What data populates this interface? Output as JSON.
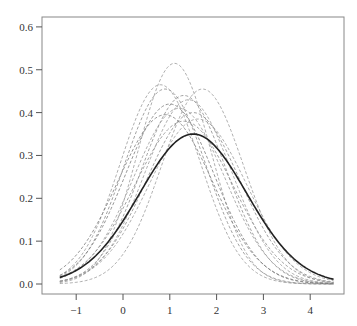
{
  "chart_data": {
    "type": "line",
    "title": "",
    "xlabel": "",
    "ylabel": "",
    "xlim": [
      -1.7,
      4.75
    ],
    "ylim": [
      -0.024,
      0.625
    ],
    "x_range_drawn": [
      -1.35,
      4.5
    ],
    "grid": false,
    "legend": null,
    "x_ticks": [
      -1,
      0,
      1,
      2,
      3,
      4
    ],
    "x_tick_labels": [
      "-1",
      "0",
      "1",
      "2",
      "3",
      "4"
    ],
    "y_ticks": [
      0.0,
      0.1,
      0.2,
      0.3,
      0.4,
      0.5,
      0.6
    ],
    "y_tick_labels": [
      "0.0",
      "0.1",
      "0.2",
      "0.3",
      "0.4",
      "0.5",
      "0.6"
    ],
    "series": [
      {
        "name": "reference-density",
        "style": "solid",
        "color": "#222222",
        "width": 1.6,
        "mean": 1.5,
        "peak": 0.35
      },
      {
        "name": "sample-1",
        "style": "dashed",
        "color": "#9a9a9a",
        "width": 0.8,
        "mean": 1.1,
        "peak": 0.515
      },
      {
        "name": "sample-2",
        "style": "dashed",
        "color": "#9a9a9a",
        "width": 0.8,
        "mean": 0.8,
        "peak": 0.465
      },
      {
        "name": "sample-3",
        "style": "dashed",
        "color": "#8a8a8a",
        "width": 0.8,
        "mean": 0.9,
        "peak": 0.455
      },
      {
        "name": "sample-4",
        "style": "dashed",
        "color": "#9a9a9a",
        "width": 0.8,
        "mean": 1.7,
        "peak": 0.455
      },
      {
        "name": "sample-5",
        "style": "dashed",
        "color": "#8a8a8a",
        "width": 0.8,
        "mean": 1.3,
        "peak": 0.44
      },
      {
        "name": "sample-6",
        "style": "dashed",
        "color": "#9a9a9a",
        "width": 0.8,
        "mean": 1.4,
        "peak": 0.43
      },
      {
        "name": "sample-7",
        "style": "dashed",
        "color": "#7a7a7a",
        "width": 0.8,
        "mean": 1.0,
        "peak": 0.42
      },
      {
        "name": "sample-8",
        "style": "dashed",
        "color": "#9a9a9a",
        "width": 0.8,
        "mean": 1.2,
        "peak": 0.41
      },
      {
        "name": "sample-9",
        "style": "dashed",
        "color": "#8a8a8a",
        "width": 0.8,
        "mean": 1.5,
        "peak": 0.4
      },
      {
        "name": "sample-10",
        "style": "dashed",
        "color": "#7a7a7a",
        "width": 0.8,
        "mean": 0.9,
        "peak": 0.395
      },
      {
        "name": "sample-11",
        "style": "dashed",
        "color": "#9a9a9a",
        "width": 0.8,
        "mean": 1.6,
        "peak": 0.385
      },
      {
        "name": "sample-12",
        "style": "dashed",
        "color": "#8a8a8a",
        "width": 0.8,
        "mean": 1.3,
        "peak": 0.38
      }
    ]
  },
  "layout": {
    "plot_box": {
      "left": 42,
      "top": 17,
      "right": 344,
      "bottom": 294
    },
    "axis_color": "#555555",
    "frame_color": "#888888"
  }
}
